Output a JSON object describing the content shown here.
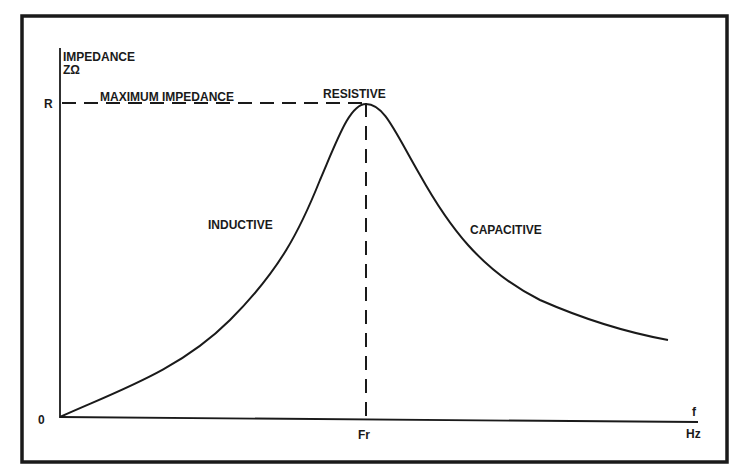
{
  "diagram": {
    "y_axis": {
      "label_line1": "IMPEDANCE",
      "label_line2": "ZΩ",
      "tick_R": "R",
      "origin": "0"
    },
    "x_axis": {
      "label_line1": "f",
      "label_line2": "Hz",
      "tick_fr": "Fr"
    },
    "annotations": {
      "max_impedance": "MAXIMUM IMPEDANCE",
      "resistive": "RESISTIVE",
      "inductive": "INDUCTIVE",
      "capacitive": "CAPACITIVE"
    },
    "colors": {
      "ink": "#1a1a1a",
      "background": "#ffffff"
    }
  }
}
